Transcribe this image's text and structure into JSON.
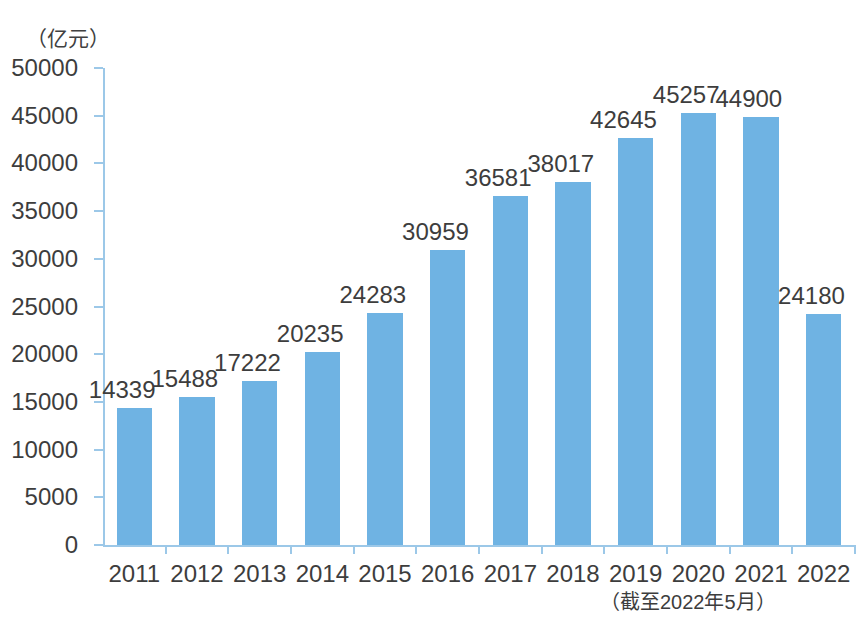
{
  "chart_data": {
    "type": "bar",
    "title": "",
    "subtitle": "",
    "xlabel": "",
    "ylabel": "（亿元）",
    "unit_label": "（亿元）",
    "footnote": "（截至2022年5月）",
    "categories": [
      "2011",
      "2012",
      "2013",
      "2014",
      "2015",
      "2016",
      "2017",
      "2018",
      "2019",
      "2020",
      "2021",
      "2022"
    ],
    "values": [
      14339,
      15488,
      17222,
      20235,
      24283,
      30959,
      36581,
      38017,
      42645,
      45257,
      44900,
      24180
    ],
    "value_labels": [
      "14339",
      "15488",
      "17222",
      "20235",
      "24283",
      "30959",
      "36581",
      "38017",
      "42645",
      "45257",
      "44900",
      "24180"
    ],
    "ylim": [
      0,
      50000
    ],
    "ytick_values": [
      0,
      5000,
      10000,
      15000,
      20000,
      25000,
      30000,
      35000,
      40000,
      45000,
      50000
    ],
    "ytick_labels": [
      "0",
      "5000",
      "10000",
      "15000",
      "20000",
      "25000",
      "30000",
      "35000",
      "40000",
      "45000",
      "50000"
    ],
    "grid": false,
    "legend": null,
    "legend_position": "none",
    "series": [
      {
        "name": "",
        "values": [
          14339,
          15488,
          17222,
          20235,
          24283,
          30959,
          36581,
          38017,
          42645,
          45257,
          44900,
          24180
        ],
        "color": "#6fb3e3"
      }
    ],
    "colors": {
      "bar": "#6fb3e3",
      "axis": "#9cc8e8",
      "text": "#3d3d3d",
      "background": "#ffffff"
    }
  }
}
